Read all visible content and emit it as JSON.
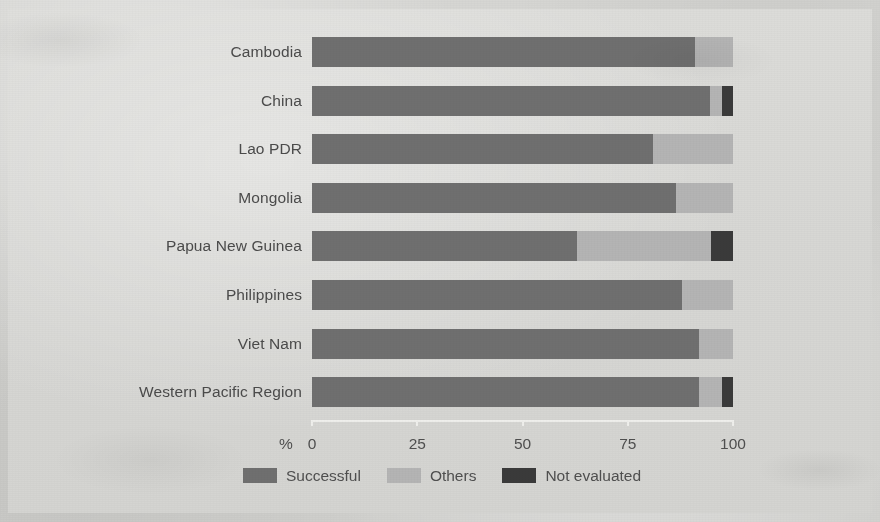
{
  "chart_data": {
    "type": "bar",
    "orientation": "horizontal",
    "stacked": true,
    "stack_total": 100,
    "title": "",
    "subtitle": "",
    "xlabel": "%",
    "ylabel": "",
    "xlim": [
      0,
      100
    ],
    "xticks": [
      0,
      25,
      50,
      75,
      100
    ],
    "xtick_labels": [
      "0",
      "25",
      "50",
      "75",
      "100"
    ],
    "grid": false,
    "legend_position": "bottom",
    "categories": [
      "Cambodia",
      "China",
      "Lao PDR",
      "Mongolia",
      "Papua New Guinea",
      "Philippines",
      "Viet Nam",
      "Western Pacific Region"
    ],
    "series": [
      {
        "name": "Successful",
        "color": "#6f6f6f",
        "values": [
          91,
          94.5,
          81,
          86.5,
          63,
          88,
          92,
          92
        ]
      },
      {
        "name": "Others",
        "color": "#b4b4b4",
        "values": [
          9,
          3,
          19,
          13.5,
          31.8,
          12,
          8,
          5.5
        ]
      },
      {
        "name": "Not evaluated",
        "color": "#3a3a3a",
        "values": [
          0,
          2.5,
          0,
          0,
          5.2,
          0,
          0,
          2.5
        ]
      }
    ]
  },
  "axis": {
    "unit_label": "%"
  },
  "legend": {
    "items": [
      {
        "label": "Successful",
        "color": "#6f6f6f"
      },
      {
        "label": "Others",
        "color": "#b4b4b4"
      },
      {
        "label": "Not evaluated",
        "color": "#3a3a3a"
      }
    ]
  }
}
